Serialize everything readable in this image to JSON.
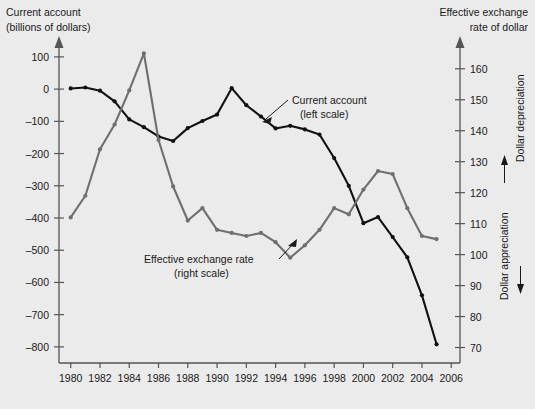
{
  "chart_data": {
    "type": "line",
    "title": "",
    "xlabel": "",
    "left_axis": {
      "label_line1": "Current account",
      "label_line2": "(billions of dollars)",
      "ticks": [
        100,
        0,
        -100,
        -200,
        -300,
        -400,
        -500,
        -600,
        -700,
        -800
      ],
      "ylim": [
        -850,
        140
      ]
    },
    "right_axis": {
      "label_line1": "Effective exchange",
      "label_line2": "rate of dollar",
      "ticks": [
        160,
        150,
        140,
        130,
        120,
        110,
        100,
        90,
        80,
        70
      ],
      "ylim": [
        65,
        168
      ],
      "side_note_up": "Dollar appreciation",
      "side_note_down": "Dollar depreciation"
    },
    "x": [
      1980,
      1981,
      1982,
      1983,
      1984,
      1985,
      1986,
      1987,
      1988,
      1989,
      1990,
      1991,
      1992,
      1993,
      1994,
      1995,
      1996,
      1997,
      1998,
      1999,
      2000,
      2001,
      2002,
      2003,
      2004,
      2005
    ],
    "xticks": [
      1980,
      1982,
      1984,
      1986,
      1988,
      1990,
      1992,
      1994,
      1996,
      1998,
      2000,
      2002,
      2004,
      2006
    ],
    "xlim": [
      1979.2,
      2006.6
    ],
    "grid": false,
    "legend": "annotations",
    "series": [
      {
        "name": "Current account (left scale)",
        "axis": "left",
        "color": "#111111",
        "annotation_line1": "Current account",
        "annotation_line2": "(left scale)",
        "values": [
          2,
          5,
          -5,
          -38,
          -94,
          -118,
          -147,
          -161,
          -121,
          -99,
          -79,
          3,
          -50,
          -85,
          -122,
          -114,
          -125,
          -141,
          -214,
          -300,
          -416,
          -397,
          -459,
          -522,
          -640,
          -792
        ]
      },
      {
        "name": "Effective exchange rate (right scale)",
        "axis": "right",
        "color": "#6f6f6f",
        "annotation_line1": "Effective exchange rate",
        "annotation_line2": "(right scale)",
        "values": [
          112,
          119,
          134,
          142,
          153,
          165,
          137,
          122,
          111,
          115,
          108,
          107,
          106,
          107,
          104,
          99,
          103,
          108,
          115,
          113,
          121,
          127,
          126,
          115,
          106,
          105
        ]
      }
    ]
  }
}
